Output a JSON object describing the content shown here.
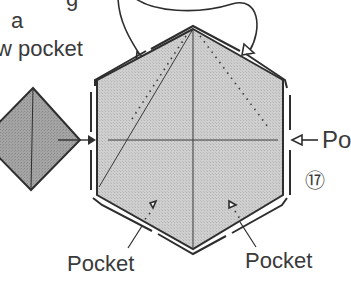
{
  "diagram": {
    "type": "origami-instruction",
    "step_number": "17",
    "step_number_display": "⑰",
    "instruction_text_lines": [
      "g",
      "a",
      "w pocket"
    ],
    "labels": {
      "pocket_right": "Po",
      "pocket_bottom_left": "Pocket",
      "pocket_bottom_right": "Pocket"
    },
    "colors": {
      "paper_fill": "#c8c8c8",
      "diamond_fill": "#9a9a9a",
      "line": "#2e2e2e",
      "text": "#3a3a3a",
      "background": "#ffffff"
    },
    "elements": [
      {
        "name": "hexagon",
        "description": "Hexagonal folded unit with pockets on each edge"
      },
      {
        "name": "diamond",
        "description": "Diamond-shaped unit being inserted into left pocket"
      },
      {
        "name": "curved-arrow",
        "description": "Curved arrow indicating flap tucked into upper pockets"
      },
      {
        "name": "insert-arrow-left",
        "description": "Arrow pushing diamond into left pocket"
      },
      {
        "name": "insert-arrow-right",
        "description": "Arrow pointing into right pocket"
      },
      {
        "name": "pocket-arrow-bottom-left",
        "description": "Dotted arrow marking bottom-left pocket"
      },
      {
        "name": "pocket-arrow-bottom-right",
        "description": "Dotted arrow marking bottom-right pocket"
      }
    ]
  }
}
